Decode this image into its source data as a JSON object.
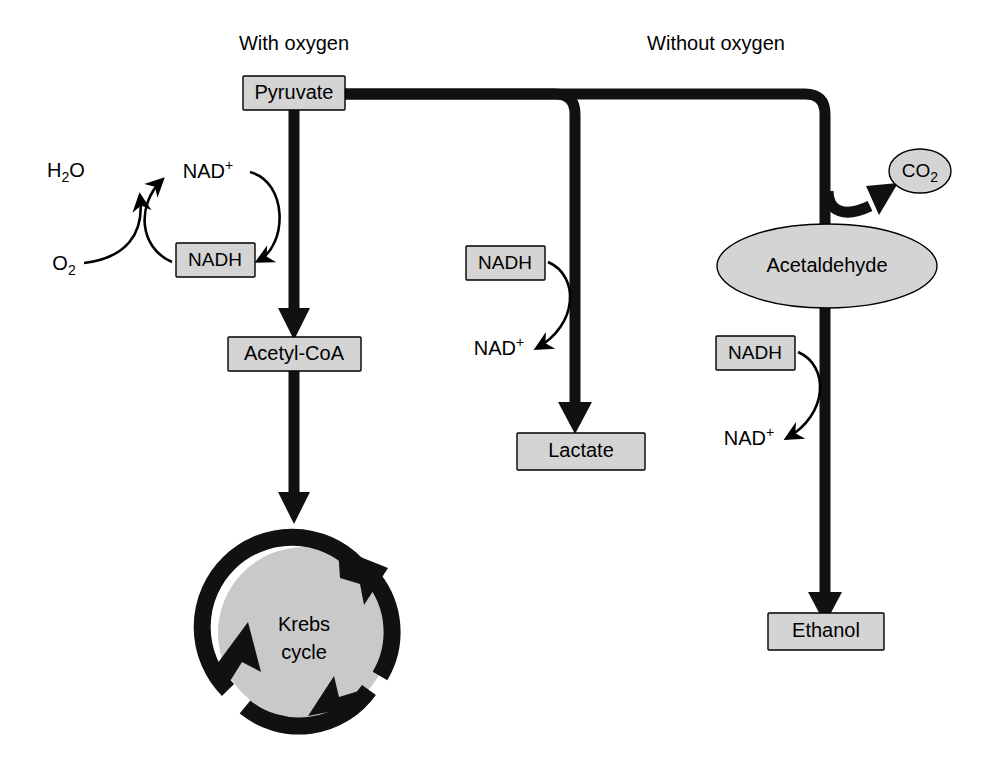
{
  "diagram": {
    "title_visible": false,
    "headers": {
      "with_oxygen": "With oxygen",
      "without_oxygen": "Without oxygen"
    },
    "nodes": {
      "pyruvate": "Pyruvate",
      "acetyl_coa": "Acetyl-CoA",
      "krebs_line1": "Krebs",
      "krebs_line2": "cycle",
      "lactate": "Lactate",
      "acetaldehyde": "Acetaldehyde",
      "ethanol": "Ethanol",
      "co2_main": "CO",
      "co2_sub": "2"
    },
    "cofactors": {
      "water_main": "H",
      "water_sub": "2",
      "water_tail": "O",
      "oxygen_main": "O",
      "oxygen_sub": "2",
      "nad_plus_main": "NAD",
      "nad_plus_sup": "+",
      "nadh": "NADH",
      "nadh_lactate": "NADH",
      "nad_plus_lactate_main": "NAD",
      "nad_plus_lactate_sup": "+",
      "nadh_ethanol": "NADH",
      "nad_plus_ethanol_main": "NAD",
      "nad_plus_ethanol_sup": "+"
    },
    "colors": {
      "box_fill": "#d4d4d4",
      "krebs_fill": "#c9c9c9",
      "stroke": "#111111",
      "background": "#ffffff"
    }
  }
}
